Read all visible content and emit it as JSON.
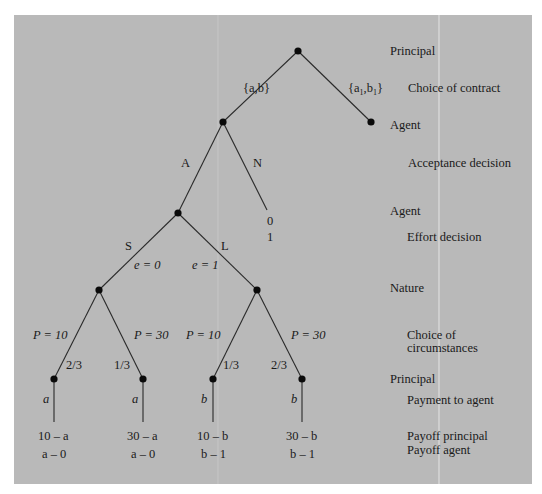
{
  "colors": {
    "panel_background": "#b9b9b9",
    "page_background": "#ffffff",
    "line": "#2a2a2a",
    "node": "#0a0a0a",
    "seam": "#e4e4e4"
  },
  "stage_labels": {
    "principal_1": "Principal",
    "choice_of_contract": "Choice of contract",
    "agent_1": "Agent",
    "acceptance_decision": "Acceptance decision",
    "agent_2": "Agent",
    "effort_decision": "Effort decision",
    "nature": "Nature",
    "choice_of_circumstances_1": "Choice of",
    "choice_of_circumstances_2": "circumstances",
    "principal_2": "Principal",
    "payment_to_agent": "Payment to agent",
    "payoff_principal": "Payoff principal",
    "payoff_agent": "Payoff agent"
  },
  "tree": {
    "contract_left": "{a,b}",
    "contract_right_prefix": "{a",
    "contract_right_sub1": "1",
    "contract_right_mid": ",b",
    "contract_right_sub2": "1",
    "contract_right_suffix": "}",
    "accept": "A",
    "reject": "N",
    "reject_payoff_principal": "0",
    "reject_payoff_agent": "1",
    "shirk": "S",
    "labor": "L",
    "effort_low": "e = 0",
    "effort_high": "e = 1",
    "branches": [
      {
        "price": "P = 10",
        "prob": "2/3",
        "payment": "a",
        "payoff_principal": "10 – a",
        "payoff_agent": "a – 0"
      },
      {
        "price": "P = 30",
        "prob": "1/3",
        "payment": "a",
        "payoff_principal": "30 – a",
        "payoff_agent": "a – 0"
      },
      {
        "price": "P = 10",
        "prob": "1/3",
        "payment": "b",
        "payoff_principal": "10 – b",
        "payoff_agent": "b – 1"
      },
      {
        "price": "P = 30",
        "prob": "2/3",
        "payment": "b",
        "payoff_principal": "30 – b",
        "payoff_agent": "b – 1"
      }
    ]
  }
}
